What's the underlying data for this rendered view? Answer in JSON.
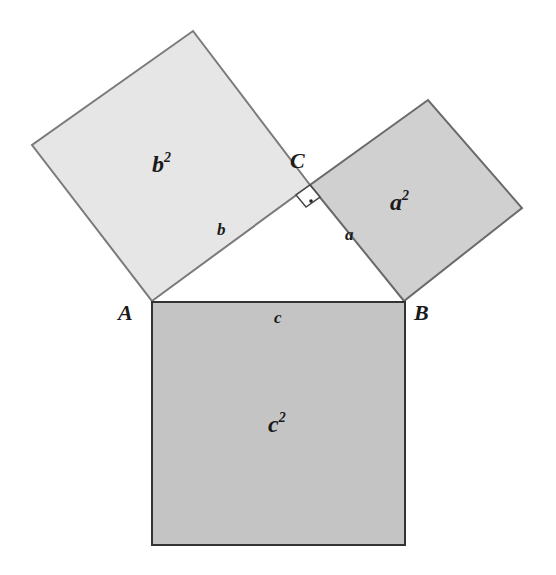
{
  "diagram": {
    "type": "pythagorean-theorem",
    "colors": {
      "square_b": "#e6e6e6",
      "square_a": "#d0d0d0",
      "square_c": "#c4c4c4",
      "outline_light": "#7a7a7a",
      "outline_dark": "#333333",
      "text": "#1a1a1a"
    },
    "vertices": {
      "A": "A",
      "B": "B",
      "C": "C"
    },
    "sides": {
      "a": "a",
      "b": "b",
      "c": "c"
    },
    "areas": {
      "a_base": "a",
      "b_base": "b",
      "c_base": "c",
      "exp": "2"
    }
  }
}
